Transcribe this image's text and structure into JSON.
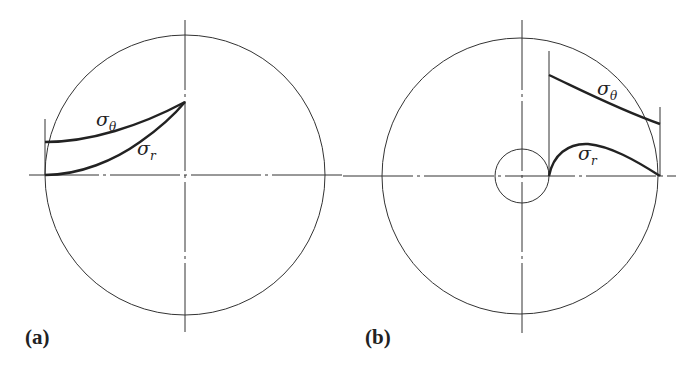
{
  "figure": {
    "panels": [
      {
        "id": "a",
        "label": "(a)",
        "description": "Solid disk: stress distribution along radius",
        "sigma_theta": {
          "symbol": "σ",
          "subscript": "θ"
        },
        "sigma_r": {
          "symbol": "σ",
          "subscript": "r"
        }
      },
      {
        "id": "b",
        "label": "(b)",
        "description": "Disk with central hole: stress distribution along radius",
        "sigma_theta": {
          "symbol": "σ",
          "subscript": "θ"
        },
        "sigma_r": {
          "symbol": "σ",
          "subscript": "r"
        }
      }
    ]
  }
}
